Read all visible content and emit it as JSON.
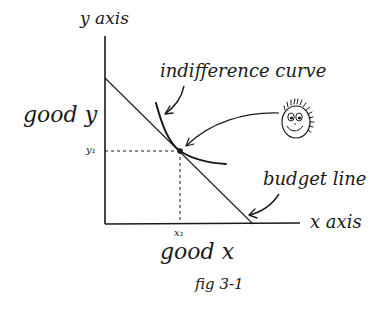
{
  "diagram": {
    "type": "economics-indifference-diagram",
    "axes": {
      "y_axis_label": "y axis",
      "x_axis_label": "x axis",
      "y_good_label": "good y",
      "x_good_label": "good x"
    },
    "point": {
      "x_label": "x₁",
      "y_label": "y₁"
    },
    "annotations": {
      "indifference_curve": "indifference curve",
      "budget_line": "budget line"
    },
    "caption": "fig 3-1",
    "colors": {
      "ink": "#1a1a1a",
      "background": "#ffffff"
    }
  }
}
